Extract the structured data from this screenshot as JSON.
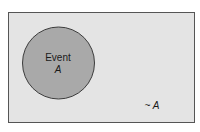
{
  "diagram": {
    "type": "venn",
    "universe": {
      "label": "~ A",
      "fill": "#e4e4e4",
      "stroke": "#555555"
    },
    "event": {
      "label_line1": "Event",
      "label_line2": "A",
      "fill": "#a9a9a9",
      "stroke": "#3c3c3c"
    },
    "background": "#ffffff"
  }
}
